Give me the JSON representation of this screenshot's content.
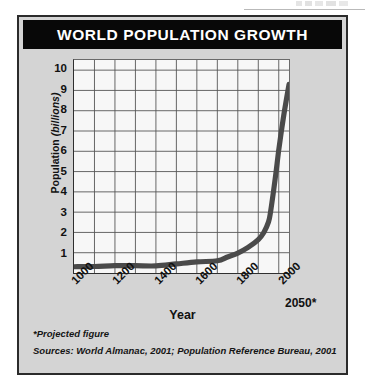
{
  "figure": {
    "title": "WORLD POPULATION GROWTH",
    "title_bar_color": "#080808",
    "panel_color": "#d4d4d4",
    "plot_background": "#f7f7f7",
    "curve_color": "#4a4a4a",
    "footnote_projected": "*Projected figure",
    "footnote_sources": "Sources: World Almanac, 2001; Population Reference Bureau, 2001"
  },
  "chart_data": {
    "type": "line",
    "title": "WORLD POPULATION GROWTH",
    "xlabel": "Year",
    "ylabel": "Population (billions)",
    "ylabel_prefix": "Population ",
    "ylabel_unit": "(billions)",
    "xlim": [
      1000,
      2050
    ],
    "ylim": [
      0,
      10.5
    ],
    "grid": true,
    "legend": false,
    "y_ticks": [
      10,
      9,
      8,
      7,
      6,
      5,
      4,
      3,
      2,
      1
    ],
    "x_ticks": [
      "1000",
      "1200",
      "1400",
      "1600",
      "1800",
      "2000"
    ],
    "x_tick_projected": "2050*",
    "x_tick_values": [
      1000,
      1200,
      1400,
      1600,
      1800,
      2000,
      2050
    ],
    "x_gridline_step": 100,
    "y_gridline_step": 1,
    "annotations": [
      "*Projected figure"
    ],
    "series": [
      {
        "name": "World population",
        "x": [
          1000,
          1100,
          1200,
          1300,
          1400,
          1500,
          1600,
          1700,
          1750,
          1800,
          1850,
          1900,
          1927,
          1950,
          1960,
          1974,
          1987,
          1999,
          2000,
          2013,
          2028,
          2050
        ],
        "values": [
          0.31,
          0.32,
          0.36,
          0.36,
          0.35,
          0.45,
          0.55,
          0.6,
          0.79,
          0.98,
          1.26,
          1.65,
          2.0,
          2.52,
          3.02,
          4.0,
          5.0,
          6.0,
          6.07,
          7.0,
          8.0,
          9.3
        ]
      }
    ]
  }
}
